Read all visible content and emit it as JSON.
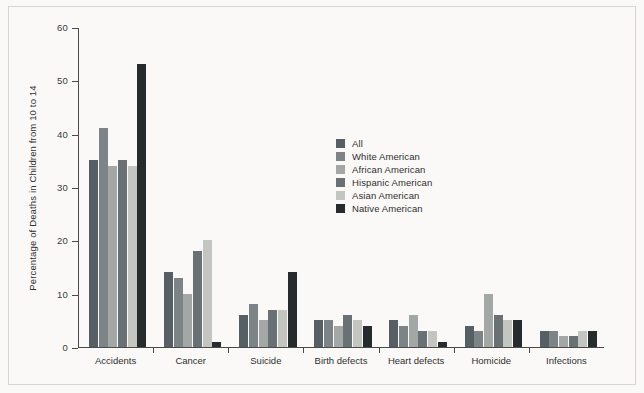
{
  "chart_data": {
    "type": "bar",
    "title": "",
    "xlabel": "",
    "ylabel": "Percentage of Deaths in Children from 10 to 14",
    "ylim": [
      0,
      60
    ],
    "yticks": [
      0,
      10,
      20,
      30,
      40,
      50,
      60
    ],
    "grid": false,
    "legend_position": "center",
    "categories": [
      "Accidents",
      "Cancer",
      "Suicide",
      "Birth defects",
      "Heart defects",
      "Homicide",
      "Infections"
    ],
    "series": [
      {
        "name": "All",
        "color": "#565f63",
        "values": [
          35,
          14,
          6,
          5,
          5,
          4,
          3
        ]
      },
      {
        "name": "White American",
        "color": "#7d8487",
        "values": [
          41,
          13,
          8,
          5,
          4,
          3,
          3
        ]
      },
      {
        "name": "African American",
        "color": "#a3a8a6",
        "values": [
          34,
          10,
          5,
          4,
          6,
          10,
          2
        ]
      },
      {
        "name": "Hispanic American",
        "color": "#6a7175",
        "values": [
          35,
          18,
          7,
          6,
          3,
          6,
          2
        ]
      },
      {
        "name": "Asian American",
        "color": "#c2c5c0",
        "values": [
          34,
          20,
          7,
          5,
          3,
          5,
          3
        ]
      },
      {
        "name": "Native American",
        "color": "#262b2e",
        "values": [
          53,
          1,
          14,
          4,
          1,
          5,
          3
        ]
      }
    ]
  },
  "figure": {
    "background_color": "#faf9f7",
    "axis_color": "#4a4a4a",
    "text_color": "#2f2f2f"
  }
}
